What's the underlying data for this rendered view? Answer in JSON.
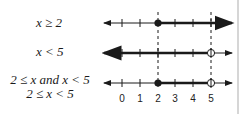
{
  "diagram": {
    "type": "number-line-intersection",
    "rows": [
      {
        "label": "x ≥ 2",
        "endpoint_start": 2,
        "start_closed": true,
        "direction": "right",
        "endpoint_end": null
      },
      {
        "label": "x < 5",
        "endpoint_start": null,
        "direction": "left",
        "endpoint_end": 5,
        "end_closed": false
      },
      {
        "label_line1": "2 ≤ x and x < 5",
        "label_line2": "2 ≤ x < 5",
        "endpoint_start": 2,
        "start_closed": true,
        "endpoint_end": 5,
        "end_closed": false
      }
    ],
    "ticks": [
      "0",
      "1",
      "2",
      "3",
      "4",
      "5"
    ],
    "dashed_guides_at": [
      2,
      5
    ],
    "colors": {
      "line": "#1a1a1a",
      "dashed": "#1a1a1a",
      "edge_bar": "#d6d6d6"
    }
  }
}
